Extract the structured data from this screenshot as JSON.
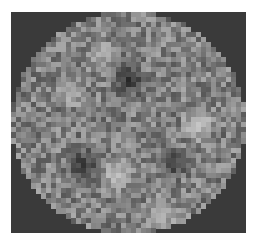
{
  "image": {
    "description": "pixelated grayscale circular disk with three dark spots",
    "frame": {
      "x": 11,
      "y": 12,
      "width": 235,
      "height": 221,
      "background": "#3a3a3a"
    },
    "grid": {
      "cols": 47,
      "rows": 44,
      "cell_w": 5,
      "cell_h": 5.02,
      "seed": 1337
    },
    "disk": {
      "cx": 23.5,
      "cy": 22,
      "rx": 23.3,
      "ry": 22.2,
      "base_gray": 128,
      "noise_amp": 42
    },
    "features": [
      {
        "type": "dark",
        "cx": 23.8,
        "cy": 13.8,
        "r": 2.6,
        "gray": 45
      },
      {
        "type": "dark",
        "cx": 14.5,
        "cy": 30.6,
        "r": 2.8,
        "gray": 50
      },
      {
        "type": "dark",
        "cx": 32.5,
        "cy": 30.0,
        "r": 2.5,
        "gray": 55
      },
      {
        "type": "bright",
        "cx": 37.5,
        "cy": 22.5,
        "r": 2.5,
        "gray": 200
      },
      {
        "type": "bright",
        "cx": 30.0,
        "cy": 40.0,
        "r": 2.5,
        "gray": 190
      },
      {
        "type": "bright",
        "cx": 21.0,
        "cy": 32.5,
        "r": 2.6,
        "gray": 185
      },
      {
        "type": "bright",
        "cx": 12.0,
        "cy": 16.0,
        "r": 2.4,
        "gray": 180
      },
      {
        "type": "bright",
        "cx": 18.0,
        "cy": 8.0,
        "r": 2.0,
        "gray": 175
      }
    ]
  }
}
